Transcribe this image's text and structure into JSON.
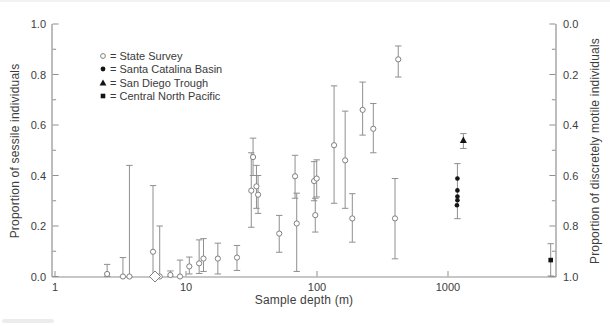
{
  "chart_data": {
    "type": "scatter",
    "title": "",
    "xlabel": "Sample depth (m)",
    "ylabel_left": "Proportion of sessile individuals",
    "ylabel_right": "Proportion of discretely motile individuals",
    "x_scale": "log",
    "xlim": [
      1,
      6700
    ],
    "ylim_left": [
      0.0,
      1.0
    ],
    "ylim_right_top_to_bottom": [
      0.0,
      1.0
    ],
    "x_ticks": [
      1,
      10,
      100,
      1000
    ],
    "y_ticks_left": [
      "1.0",
      "0.8",
      "0.6",
      "0.4",
      "0.2",
      "0.0"
    ],
    "y_ticks_right": [
      "0.0",
      "0.2",
      "0.4",
      "0.6",
      "0.8",
      "1.0"
    ],
    "y_minor_step": 0.1,
    "grid": false,
    "legend": {
      "position": "upper-left-inside",
      "items": [
        {
          "marker": "open-circle",
          "label": "= State Survey"
        },
        {
          "marker": "filled-circle",
          "label": "= Santa Catalina Basin"
        },
        {
          "marker": "filled-triangle",
          "label": "= San Diego Trough"
        },
        {
          "marker": "filled-square",
          "label": "= Central North Pacific"
        }
      ]
    },
    "series": [
      {
        "name": "State Survey",
        "marker": "open-circle",
        "points": [
          {
            "x": 2.5,
            "y": 0.01,
            "lo": 0.0,
            "hi": 0.048
          },
          {
            "x": 3.3,
            "y": 0.0,
            "lo": 0.0,
            "hi": 0.075
          },
          {
            "x": 3.7,
            "y": 0.0,
            "lo": 0.0,
            "hi": 0.44
          },
          {
            "x": 5.6,
            "y": 0.098,
            "lo": 0.0,
            "hi": 0.36
          },
          {
            "x": 6.3,
            "y": 0.0,
            "lo": 0.0,
            "hi": 0.2
          },
          {
            "x": 7.6,
            "y": 0.006,
            "lo": 0.0,
            "hi": 0.022
          },
          {
            "x": 9.0,
            "y": 0.0,
            "lo": 0.0,
            "hi": 0.065
          },
          {
            "x": 10.6,
            "y": 0.04,
            "lo": 0.01,
            "hi": 0.077
          },
          {
            "x": 12.6,
            "y": 0.052,
            "lo": 0.012,
            "hi": 0.145
          },
          {
            "x": 13.6,
            "y": 0.071,
            "lo": 0.02,
            "hi": 0.15
          },
          {
            "x": 17.5,
            "y": 0.071,
            "lo": 0.01,
            "hi": 0.132
          },
          {
            "x": 24.5,
            "y": 0.075,
            "lo": 0.024,
            "hi": 0.123
          },
          {
            "x": 31.5,
            "y": 0.34,
            "lo": 0.195,
            "hi": 0.49
          },
          {
            "x": 32.5,
            "y": 0.473,
            "lo": 0.4,
            "hi": 0.548
          },
          {
            "x": 34.5,
            "y": 0.357,
            "lo": 0.27,
            "hi": 0.44
          },
          {
            "x": 35.5,
            "y": 0.324,
            "lo": 0.25,
            "hi": 0.4
          },
          {
            "x": 51.5,
            "y": 0.17,
            "lo": 0.096,
            "hi": 0.242
          },
          {
            "x": 68,
            "y": 0.397,
            "lo": 0.31,
            "hi": 0.48
          },
          {
            "x": 70,
            "y": 0.21,
            "lo": 0.02,
            "hi": 0.33
          },
          {
            "x": 95,
            "y": 0.378,
            "lo": 0.3,
            "hi": 0.455
          },
          {
            "x": 99.5,
            "y": 0.388,
            "lo": 0.315,
            "hi": 0.462
          },
          {
            "x": 97,
            "y": 0.243,
            "lo": 0.176,
            "hi": 0.31
          },
          {
            "x": 135,
            "y": 0.52,
            "lo": 0.29,
            "hi": 0.755
          },
          {
            "x": 164,
            "y": 0.46,
            "lo": 0.27,
            "hi": 0.655
          },
          {
            "x": 186,
            "y": 0.23,
            "lo": 0.136,
            "hi": 0.328
          },
          {
            "x": 223,
            "y": 0.66,
            "lo": 0.56,
            "hi": 0.77
          },
          {
            "x": 269,
            "y": 0.585,
            "lo": 0.49,
            "hi": 0.685
          },
          {
            "x": 394,
            "y": 0.23,
            "lo": 0.07,
            "hi": 0.388
          },
          {
            "x": 417,
            "y": 0.86,
            "lo": 0.79,
            "hi": 0.913
          }
        ]
      },
      {
        "name": "State Survey zero-depth diamond",
        "marker": "open-diamond",
        "points": [
          {
            "x": 5.8,
            "y": 0.0
          }
        ]
      },
      {
        "name": "Santa Catalina Basin",
        "marker": "filled-circle",
        "points": [
          {
            "x": 1180,
            "y": 0.388,
            "lo": 0.229,
            "hi": 0.447
          },
          {
            "x": 1180,
            "y": 0.341
          },
          {
            "x": 1180,
            "y": 0.317
          },
          {
            "x": 1180,
            "y": 0.302
          },
          {
            "x": 1170,
            "y": 0.282
          }
        ]
      },
      {
        "name": "San Diego Trough",
        "marker": "filled-triangle",
        "points": [
          {
            "x": 1310,
            "y": 0.54,
            "lo": 0.507,
            "hi": 0.566
          }
        ]
      },
      {
        "name": "Central North Pacific",
        "marker": "filled-square",
        "points": [
          {
            "x": 6080,
            "y": 0.065,
            "lo": 0.002,
            "hi": 0.13
          }
        ]
      }
    ],
    "colors": {
      "axis": "#8f8f8f",
      "error_bar": "#8f8f8f",
      "open_marker_stroke": "#808080",
      "filled_marker": "#141414",
      "text": "#3d3d3d",
      "background": "#ffffff"
    }
  }
}
